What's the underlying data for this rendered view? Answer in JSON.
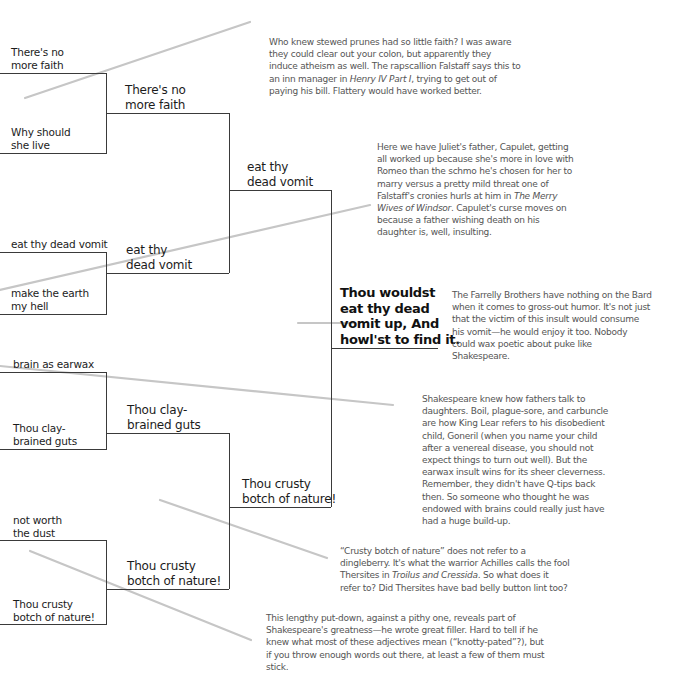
{
  "bracket": {
    "round1": [
      {
        "label": "There's no\nmore faith",
        "line1": "There's no",
        "line2": "more faith"
      },
      {
        "label": "Why should\nshe live",
        "line1": "Why should",
        "line2": "she live"
      },
      {
        "label": "eat thy dead vomit",
        "line1": "eat thy dead vomit",
        "line2": ""
      },
      {
        "label": "make the earth\nmy hell",
        "line1": "make the earth",
        "line2": "my hell"
      },
      {
        "label": "brain as earwax",
        "line1": "brain as earwax",
        "line2": ""
      },
      {
        "label": "Thou clay-\nbrained guts",
        "line1": "Thou clay-",
        "line2": "brained guts"
      },
      {
        "label": "not worth\nthe dust",
        "line1": "not worth",
        "line2": "the dust"
      },
      {
        "label": "Thou crusty\nbotch of nature!",
        "line1": "Thou crusty",
        "line2": "botch of nature!"
      }
    ],
    "round2": [
      {
        "line1": "There's no",
        "line2": "more faith"
      },
      {
        "line1": "eat thy",
        "line2": "dead vomit"
      },
      {
        "line1": "Thou clay-",
        "line2": "brained guts"
      },
      {
        "line1": "Thou crusty",
        "line2": "botch of nature!"
      }
    ],
    "round3": [
      {
        "line1": "eat thy",
        "line2": "dead vomit"
      },
      {
        "line1": "Thou crusty",
        "line2": "botch of nature!"
      }
    ],
    "winner": {
      "line1": "Thou wouldst",
      "line2": "eat thy dead",
      "line3": "vomit up, And",
      "line4": "howl'st to find it."
    }
  },
  "annotations": [
    {
      "id": "faith",
      "parts": [
        "Who knew stewed prunes had so little faith? I was aware they could clear out your colon, but apparently they induce atheism as well. The rapscallion Falstaff says this to an inn manager in ",
        "Henry IV Part I",
        ", trying to get out of paying his bill. Flattery would have worked better."
      ]
    },
    {
      "id": "capulet",
      "parts": [
        "Here we have Juliet's father, Capulet, getting all worked up because she's more in love with Romeo than the schmo he's chosen for her to marry versus a pretty mild threat one of Falstaff's cronies hurls at him in ",
        "The Merry Wives of Windsor",
        ". Capulet's curse moves on because a father wishing death on his daughter is, well, insulting."
      ]
    },
    {
      "id": "farrelly",
      "parts": [
        "The Farrelly Brothers have nothing on the Bard when it comes to gross-out humor. It's not just that the victim of this insult would consume his vomit—he would enjoy it too. Nobody could wax poetic about puke like Shakespeare."
      ]
    },
    {
      "id": "lear",
      "parts": [
        "Shakespeare knew how fathers talk to daughters. Boil, plague-sore, and carbuncle are how King Lear refers to his disobedient child, Goneril (when you name your child after a venereal disease, you should not expect things to turn out well). But the earwax insult wins for its sheer cleverness. Remember, they didn't have Q-tips back then. So someone who thought he was endowed with brains could really just have had a huge build-up."
      ]
    },
    {
      "id": "crusty",
      "parts": [
        "“Crusty botch of nature” does not refer to a dingleberry. It's what the warrior Achilles calls the fool Thersites in ",
        "Troilus and Cressida",
        ". So what does it refer to? Did Thersites have bad belly button lint too?"
      ]
    },
    {
      "id": "filler",
      "parts": [
        "This lengthy put-down, against a pithy one, reveals part of Shakespeare's greatness—he wrote great filler. Hard to tell if he knew what most of these adjectives mean (“knotty-pated”?), but if you throw enough words out there, at least a few of them must stick."
      ]
    }
  ],
  "colors": {
    "bracket_line": "#3a3a3a",
    "pointer_line": "#c4c4c4",
    "note_text": "#555555",
    "label_text": "#1c1c1c"
  }
}
